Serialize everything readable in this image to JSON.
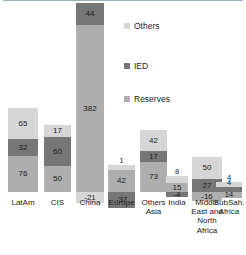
{
  "chart_data": {
    "type": "bar",
    "subtype": "stacked-bar-with-negatives",
    "title": "",
    "xlabel": "",
    "ylabel": "",
    "grid": false,
    "legend_position": "upper-center-right",
    "categories": [
      "LatAm",
      "CIS",
      "China",
      "Europe",
      "Others Asia",
      "India",
      "Middle East and North Africa",
      "SubSah. Africa"
    ],
    "series": [
      {
        "name": "Others",
        "color": "#d6d6d6",
        "values": [
          65,
          17,
          -21,
          1,
          42,
          8,
          50,
          4
        ]
      },
      {
        "name": "IED",
        "color": "#767676",
        "values": [
          32,
          60,
          44,
          -37,
          17,
          -4,
          27,
          4
        ]
      },
      {
        "name": "Reserves",
        "color": "#aeaeae",
        "values": [
          76,
          50,
          382,
          42,
          73,
          15,
          -16,
          14
        ]
      }
    ],
    "ylim": [
      -60,
      440
    ],
    "zero_line_color": "#9ab0c8"
  },
  "legend": {
    "items": [
      {
        "label": "Others",
        "color": "#d6d6d6",
        "icon": "square-swatch-icon"
      },
      {
        "label": "IED",
        "color": "#767676",
        "icon": "square-swatch-icon"
      },
      {
        "label": "Reserves",
        "color": "#aeaeae",
        "icon": "square-swatch-icon"
      }
    ]
  },
  "bars": [
    {
      "category": "LatAm",
      "label_lines": [
        "LatAm"
      ],
      "x": 12,
      "width": 33,
      "positive": [
        {
          "series": "Others",
          "value": 65,
          "label": "65",
          "height": 31,
          "color": "#d6d6d6"
        },
        {
          "series": "IED",
          "value": 32,
          "label": "32",
          "height": 17,
          "color": "#767676"
        },
        {
          "series": "Reserves",
          "value": 76,
          "label": "76",
          "height": 36,
          "color": "#aeaeae"
        }
      ],
      "negative": []
    },
    {
      "category": "CIS",
      "label_lines": [
        "CIS"
      ],
      "x": 51,
      "width": 33,
      "positive": [
        {
          "series": "Others",
          "value": 17,
          "label": "17",
          "height": 12,
          "color": "#d6d6d6"
        },
        {
          "series": "IED",
          "value": 60,
          "label": "60",
          "height": 29,
          "color": "#767676"
        },
        {
          "series": "Reserves",
          "value": 50,
          "label": "50",
          "height": 26,
          "color": "#aeaeae"
        }
      ],
      "negative": []
    },
    {
      "category": "China",
      "label_lines": [
        "China"
      ],
      "x": 90,
      "width": 33,
      "positive": [
        {
          "series": "IED",
          "value": 44,
          "label": "44",
          "height": 22,
          "color": "#767676"
        },
        {
          "series": "Reserves",
          "value": 382,
          "label": "382",
          "height": 167,
          "color": "#aeaeae"
        }
      ],
      "negative": [
        {
          "series": "Others",
          "value": -21,
          "label": "-21",
          "height": 11,
          "color": "#d6d6d6"
        }
      ]
    },
    {
      "category": "Europe",
      "label_lines": [
        "Europe"
      ],
      "x": 129,
      "width": 33,
      "positive": [
        {
          "series": "Others",
          "value": 1,
          "label": "1",
          "height": 5,
          "color": "#d6d6d6"
        },
        {
          "series": "Reserves",
          "value": 42,
          "label": "42",
          "height": 22,
          "color": "#aeaeae"
        }
      ],
      "negative": [
        {
          "series": "IED",
          "value": -37,
          "label": "-37",
          "height": 16,
          "color": "#767676"
        }
      ]
    },
    {
      "category": "Others Asia",
      "label_lines": [
        "Others",
        "Asia"
      ],
      "x": 168,
      "width": 33,
      "positive": [
        {
          "series": "Others",
          "value": 42,
          "label": "42",
          "height": 21,
          "color": "#d6d6d6"
        },
        {
          "series": "IED",
          "value": 17,
          "label": "17",
          "height": 11,
          "color": "#767676"
        },
        {
          "series": "Reserves",
          "value": 73,
          "label": "73",
          "height": 30,
          "color": "#aeaeae"
        }
      ],
      "negative": []
    },
    {
      "category": "India",
      "label_lines": [
        "India"
      ],
      "x": 207,
      "width": 33,
      "positive": [
        {
          "series": "Others",
          "value": 8,
          "label": "8",
          "height": 7,
          "color": "#d6d6d6"
        },
        {
          "series": "Reserves",
          "value": 15,
          "label": "15",
          "height": 9,
          "color": "#aeaeae"
        }
      ],
      "negative": [
        {
          "series": "IED",
          "value": -4,
          "label": "-4",
          "height": 5,
          "color": "#767676"
        }
      ]
    },
    {
      "category": "Middle East and North Africa",
      "label_lines": [
        "Middle",
        "East and",
        "North",
        "Africa"
      ],
      "x": 246,
      "width": 33,
      "positive": [
        {
          "series": "Others",
          "value": 50,
          "label": "50",
          "height": 22,
          "color": "#d6d6d6"
        },
        {
          "series": "IED",
          "value": 27,
          "label": "27",
          "height": 13,
          "color": "#767676"
        }
      ],
      "negative": [
        {
          "series": "Reserves",
          "value": -16,
          "label": "-16",
          "height": 9,
          "color": "#aeaeae"
        }
      ]
    },
    {
      "category": "SubSah. Africa",
      "label_lines": [
        "SubSah.",
        "Africa"
      ],
      "x": 285,
      "width": 33,
      "positive": [
        {
          "series": "Others",
          "value": 4,
          "label": "4",
          "height": 5,
          "color": "#d6d6d6"
        },
        {
          "series": "IED",
          "value": 4,
          "label": "4",
          "height": 5,
          "color": "#767676"
        }
      ],
      "negative": [
        {
          "series": "Reserves",
          "value": 14,
          "label": "14",
          "height": 6,
          "color": "#aeaeae"
        }
      ]
    }
  ],
  "layout": {
    "zero_axis_y": 192,
    "bar_slot_x": [
      8,
      44,
      76,
      108,
      140,
      166,
      192,
      216
    ],
    "bar_widths": [
      30,
      27,
      28,
      27,
      27,
      22,
      30,
      26
    ],
    "label_y": 198,
    "legend_x": 124,
    "legend_rows_y": [
      22,
      62,
      95
    ]
  }
}
